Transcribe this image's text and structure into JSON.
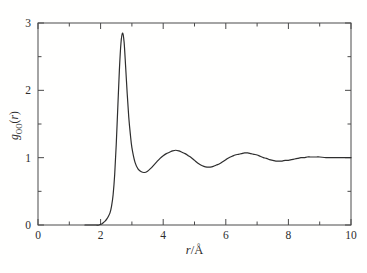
{
  "figure": {
    "x_label": {
      "quantity": "r",
      "separator": "/",
      "unit": "Å"
    },
    "y_label": {
      "quantity": "g",
      "subscript": "OO",
      "open_paren": "(",
      "argument": "r",
      "close_paren": ")"
    }
  },
  "chart_data": {
    "type": "line",
    "title": "",
    "xlabel": "r/Å",
    "ylabel": "g_OO(r)",
    "xlim": [
      0,
      10
    ],
    "ylim": [
      0,
      3
    ],
    "x_major_ticks": [
      0,
      2,
      4,
      6,
      8,
      10
    ],
    "x_minor_ticks": [
      1,
      3,
      5,
      7,
      9
    ],
    "y_major_ticks": [
      0,
      1,
      2,
      3
    ],
    "y_minor_ticks": [
      0.5,
      1.5,
      2.5
    ],
    "grid": false,
    "legend_position": "none",
    "background": "#fffffe",
    "line_color": "#2e2e2e",
    "frame_color": "#4a4a4a",
    "series": [
      {
        "name": "g_OO(r)",
        "points": [
          [
            1.5,
            0
          ],
          [
            1.7,
            0
          ],
          [
            1.85,
            0
          ],
          [
            1.95,
            0
          ],
          [
            2.0,
            0.01
          ],
          [
            2.05,
            0.02
          ],
          [
            2.1,
            0.04
          ],
          [
            2.15,
            0.06
          ],
          [
            2.2,
            0.09
          ],
          [
            2.25,
            0.13
          ],
          [
            2.3,
            0.18
          ],
          [
            2.35,
            0.28
          ],
          [
            2.4,
            0.45
          ],
          [
            2.45,
            0.75
          ],
          [
            2.5,
            1.2
          ],
          [
            2.55,
            1.75
          ],
          [
            2.6,
            2.3
          ],
          [
            2.65,
            2.7
          ],
          [
            2.7,
            2.85
          ],
          [
            2.75,
            2.72
          ],
          [
            2.8,
            2.35
          ],
          [
            2.85,
            1.95
          ],
          [
            2.9,
            1.6
          ],
          [
            2.95,
            1.35
          ],
          [
            3.0,
            1.15
          ],
          [
            3.1,
            0.93
          ],
          [
            3.2,
            0.83
          ],
          [
            3.3,
            0.79
          ],
          [
            3.4,
            0.78
          ],
          [
            3.5,
            0.8
          ],
          [
            3.6,
            0.84
          ],
          [
            3.7,
            0.89
          ],
          [
            3.8,
            0.94
          ],
          [
            3.9,
            0.99
          ],
          [
            4.0,
            1.03
          ],
          [
            4.1,
            1.06
          ],
          [
            4.2,
            1.08
          ],
          [
            4.3,
            1.1
          ],
          [
            4.4,
            1.11
          ],
          [
            4.5,
            1.1
          ],
          [
            4.6,
            1.08
          ],
          [
            4.7,
            1.06
          ],
          [
            4.8,
            1.03
          ],
          [
            4.9,
            1.0
          ],
          [
            5.0,
            0.96
          ],
          [
            5.1,
            0.92
          ],
          [
            5.2,
            0.89
          ],
          [
            5.3,
            0.87
          ],
          [
            5.4,
            0.86
          ],
          [
            5.5,
            0.86
          ],
          [
            5.6,
            0.87
          ],
          [
            5.7,
            0.89
          ],
          [
            5.8,
            0.91
          ],
          [
            5.9,
            0.94
          ],
          [
            6.0,
            0.97
          ],
          [
            6.1,
            1.0
          ],
          [
            6.2,
            1.02
          ],
          [
            6.3,
            1.04
          ],
          [
            6.4,
            1.05
          ],
          [
            6.5,
            1.06
          ],
          [
            6.6,
            1.07
          ],
          [
            6.7,
            1.07
          ],
          [
            6.8,
            1.06
          ],
          [
            6.9,
            1.05
          ],
          [
            7.0,
            1.04
          ],
          [
            7.1,
            1.02
          ],
          [
            7.2,
            1.0
          ],
          [
            7.3,
            0.99
          ],
          [
            7.4,
            0.97
          ],
          [
            7.5,
            0.96
          ],
          [
            7.6,
            0.95
          ],
          [
            7.7,
            0.95
          ],
          [
            7.8,
            0.95
          ],
          [
            7.9,
            0.96
          ],
          [
            8.0,
            0.96
          ],
          [
            8.1,
            0.97
          ],
          [
            8.2,
            0.98
          ],
          [
            8.3,
            0.99
          ],
          [
            8.4,
            1.0
          ],
          [
            8.5,
            1.0
          ],
          [
            8.6,
            1.01
          ],
          [
            8.7,
            1.01
          ],
          [
            8.8,
            1.01
          ],
          [
            8.9,
            1.01
          ],
          [
            9.0,
            1.01
          ],
          [
            9.2,
            1.0
          ],
          [
            9.4,
            1.0
          ],
          [
            9.6,
            1.0
          ],
          [
            9.8,
            1.0
          ],
          [
            10.0,
            1.0
          ]
        ]
      }
    ]
  }
}
